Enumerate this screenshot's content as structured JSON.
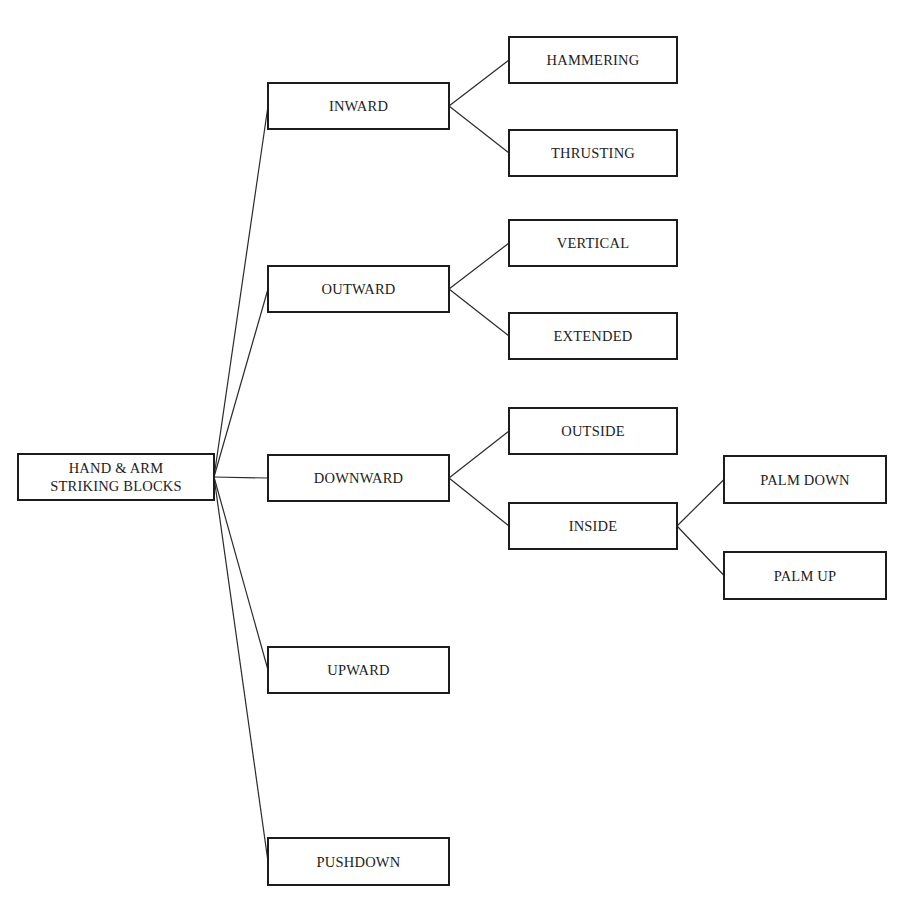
{
  "diagram": {
    "root": {
      "id": "root",
      "label": "HAND & ARM\nSTRIKING BLOCKS",
      "box": {
        "x": 17,
        "y": 453,
        "w": 198,
        "h": 48
      }
    },
    "level1": [
      {
        "id": "inward",
        "label": "INWARD",
        "box": {
          "x": 267,
          "y": 82,
          "w": 183,
          "h": 48
        }
      },
      {
        "id": "outward",
        "label": "OUTWARD",
        "box": {
          "x": 267,
          "y": 265,
          "w": 183,
          "h": 48
        }
      },
      {
        "id": "downward",
        "label": "DOWNWARD",
        "box": {
          "x": 267,
          "y": 454,
          "w": 183,
          "h": 48
        }
      },
      {
        "id": "upward",
        "label": "UPWARD",
        "box": {
          "x": 267,
          "y": 646,
          "w": 183,
          "h": 48
        }
      },
      {
        "id": "pushdown",
        "label": "PUSHDOWN",
        "box": {
          "x": 267,
          "y": 837,
          "w": 183,
          "h": 49
        }
      }
    ],
    "level2": [
      {
        "id": "hammering",
        "parent": "inward",
        "label": "HAMMERING",
        "box": {
          "x": 508,
          "y": 36,
          "w": 170,
          "h": 48
        }
      },
      {
        "id": "thrusting",
        "parent": "inward",
        "label": "THRUSTING",
        "box": {
          "x": 508,
          "y": 129,
          "w": 170,
          "h": 48
        }
      },
      {
        "id": "vertical",
        "parent": "outward",
        "label": "VERTICAL",
        "box": {
          "x": 508,
          "y": 219,
          "w": 170,
          "h": 48
        }
      },
      {
        "id": "extended",
        "parent": "outward",
        "label": "EXTENDED",
        "box": {
          "x": 508,
          "y": 312,
          "w": 170,
          "h": 48
        }
      },
      {
        "id": "outside",
        "parent": "downward",
        "label": "OUTSIDE",
        "box": {
          "x": 508,
          "y": 407,
          "w": 170,
          "h": 48
        }
      },
      {
        "id": "inside",
        "parent": "downward",
        "label": "INSIDE",
        "box": {
          "x": 508,
          "y": 502,
          "w": 170,
          "h": 48
        }
      }
    ],
    "level3": [
      {
        "id": "palm-down",
        "parent": "inside",
        "label": "PALM DOWN",
        "box": {
          "x": 723,
          "y": 455,
          "w": 164,
          "h": 49
        }
      },
      {
        "id": "palm-up",
        "parent": "inside",
        "label": "PALM UP",
        "box": {
          "x": 723,
          "y": 551,
          "w": 164,
          "h": 49
        }
      }
    ],
    "edges": [
      {
        "from": "root",
        "to": "inward"
      },
      {
        "from": "root",
        "to": "outward"
      },
      {
        "from": "root",
        "to": "downward"
      },
      {
        "from": "root",
        "to": "upward"
      },
      {
        "from": "root",
        "to": "pushdown"
      },
      {
        "from": "inward",
        "to": "hammering"
      },
      {
        "from": "inward",
        "to": "thrusting"
      },
      {
        "from": "outward",
        "to": "vertical"
      },
      {
        "from": "outward",
        "to": "extended"
      },
      {
        "from": "downward",
        "to": "outside"
      },
      {
        "from": "downward",
        "to": "inside"
      },
      {
        "from": "inside",
        "to": "palm-down"
      },
      {
        "from": "inside",
        "to": "palm-up"
      }
    ],
    "colors": {
      "border": "#1c1c1c",
      "text": "#222222",
      "line": "#2a2a2a",
      "background": "#ffffff"
    }
  }
}
